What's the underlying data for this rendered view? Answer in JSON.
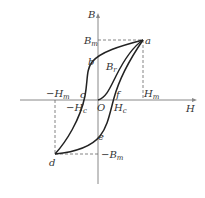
{
  "diagram": {
    "type": "hysteresis-loop",
    "axes": {
      "x_label": "H",
      "y_label": "B"
    },
    "points": {
      "a": "a",
      "b": "b",
      "c": "c",
      "d": "d",
      "e": "e",
      "f": "f",
      "O": "O"
    },
    "labels": {
      "Bm": "B",
      "Bm_sub": "m",
      "neg_Bm": "−B",
      "neg_Bm_sub": "m",
      "Hm": "H",
      "Hm_sub": "m",
      "neg_Hm": "−H",
      "neg_Hm_sub": "m",
      "Hc": "H",
      "Hc_sub": "c",
      "neg_Hc": "−H",
      "neg_Hc_sub": "c",
      "Br": "B",
      "Br_sub": "r"
    }
  }
}
